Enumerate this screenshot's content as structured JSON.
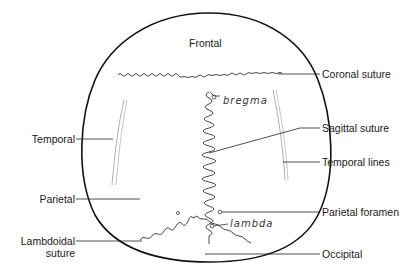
{
  "diagram": {
    "regions": {
      "frontal": "Frontal",
      "temporal": "Temporal",
      "parietal": "Parietal",
      "occipital": "Occipital"
    },
    "labels_right": {
      "coronal_suture": "Coronal suture",
      "sagittal_suture": "Sagittal suture",
      "temporal_lines": "Temporal lines",
      "parietal_foramen": "Parietal foramen",
      "occipital": "Occipital"
    },
    "labels_left": {
      "temporal": "Temporal",
      "parietal": "Parietal",
      "lambdoidal_1": "Lambdoidal",
      "lambdoidal_2": "suture"
    },
    "handwritten": {
      "bregma": "bregma",
      "lambda": "lambda"
    },
    "colors": {
      "outline": "#111111",
      "suture": "#333333",
      "leader": "#222222",
      "temporal_line": "#9a9a9a"
    }
  }
}
